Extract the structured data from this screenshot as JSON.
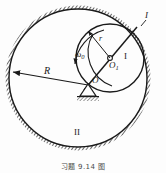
{
  "figure": {
    "caption": "习题 9.14 图",
    "colors": {
      "stroke": "#1a1a1a",
      "hatch": "#2b2b2b",
      "background": "#fdfdfd",
      "label": "#1a1a1a"
    },
    "labels": {
      "radius_R": "R",
      "radius_r": "r",
      "angular_velocity": "ω",
      "angular_velocity_sub": "0",
      "center_O1": "O",
      "center_O1_sub": "1",
      "pivot_O": "O",
      "gear_inner": "I",
      "gear_outer": "II",
      "ring_marker": "I"
    },
    "geometry": {
      "outer_circle": {
        "cx": 78,
        "cy": 78,
        "r": 69
      },
      "outer_ring_hatch_width": 7,
      "inner_circle": {
        "cx": 110,
        "cy": 58,
        "r": 34
      },
      "pivot": {
        "x": 88,
        "y": 85
      },
      "radius_arrow": {
        "x1": 88,
        "y1": 85,
        "x2": 11,
        "y2": 72
      },
      "diameter_line": {
        "x1": 84,
        "y1": 90,
        "x2": 137,
        "y2": 27
      }
    }
  }
}
